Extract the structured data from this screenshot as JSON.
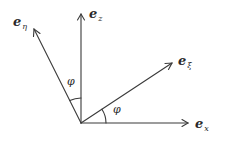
{
  "diagram": {
    "origin": {
      "x": 81,
      "y": 123
    },
    "stroke_color": "#3a3a3a",
    "vectors": [
      {
        "id": "e_x",
        "base": "e",
        "subscript": "x",
        "tip": {
          "x": 188,
          "y": 123
        },
        "label_pos": {
          "x": 195,
          "y": 117
        }
      },
      {
        "id": "e_z",
        "base": "e",
        "subscript": "z",
        "tip": {
          "x": 81,
          "y": 14
        },
        "label_pos": {
          "x": 89,
          "y": 7
        }
      },
      {
        "id": "e_xi",
        "base": "e",
        "subscript": "ξ",
        "tip": {
          "x": 172,
          "y": 63
        },
        "label_pos": {
          "x": 178,
          "y": 54
        }
      },
      {
        "id": "e_eta",
        "base": "e",
        "subscript": "η",
        "tip": {
          "x": 34,
          "y": 29
        },
        "label_pos": {
          "x": 13,
          "y": 15
        }
      }
    ],
    "angles": [
      {
        "id": "phi_upper",
        "label": "φ",
        "label_pos": {
          "x": 67,
          "y": 76
        }
      },
      {
        "id": "phi_lower",
        "label": "φ",
        "label_pos": {
          "x": 113,
          "y": 104
        }
      }
    ]
  }
}
